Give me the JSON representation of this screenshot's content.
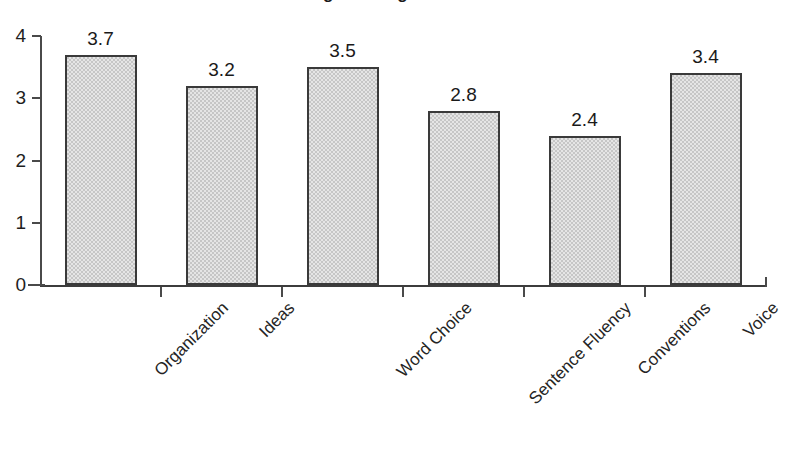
{
  "chart_data": {
    "type": "bar",
    "title": "Average Writing Trait Scores",
    "categories": [
      "Organization",
      "Ideas",
      "Word Choice",
      "Sentence Fluency",
      "Conventions",
      "Voice"
    ],
    "values": [
      3.7,
      3.2,
      3.5,
      2.8,
      2.4,
      3.4
    ],
    "value_labels": [
      "3.7",
      "3.2",
      "3.5",
      "2.8",
      "2.4",
      "3.4"
    ],
    "xlabel": "",
    "ylabel": "",
    "ylim": [
      0,
      4
    ],
    "ytick_labels": [
      "0",
      "1",
      "2",
      "3",
      "4"
    ],
    "ytick_values": [
      0,
      1,
      2,
      3,
      4
    ],
    "grid": false,
    "legend": false,
    "bar_fill_color": "#c6c6c6",
    "bar_border_color": "#3a3a3a",
    "axis_color": "#4a4a4a",
    "background_color": "#ffffff",
    "label_rotation_deg": -45
  }
}
